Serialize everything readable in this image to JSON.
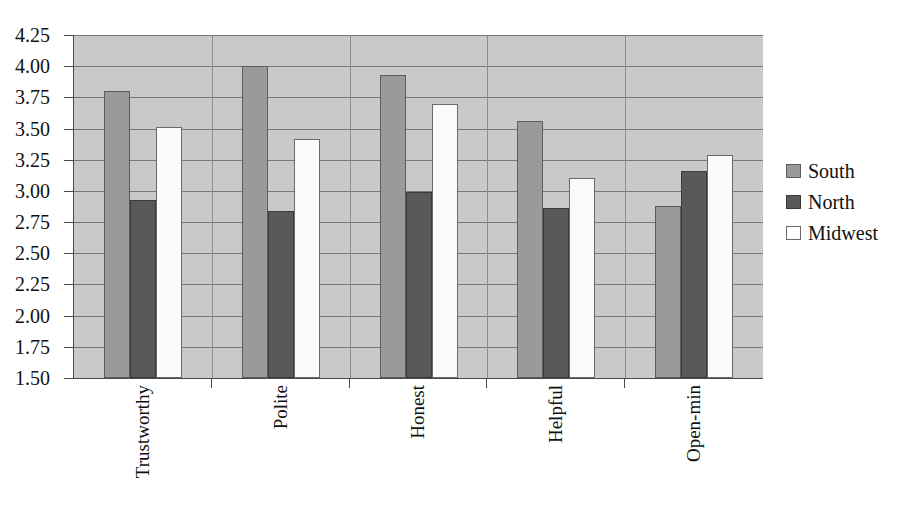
{
  "chart_data": {
    "type": "bar",
    "title": "",
    "xlabel": "",
    "ylabel": "",
    "categories": [
      "Trustworthy",
      "Polite",
      "Honest",
      "Helpful",
      "Open-min"
    ],
    "series": [
      {
        "name": "South",
        "color": "#9a9a9a",
        "values": [
          3.8,
          4.0,
          3.93,
          3.56,
          2.88
        ]
      },
      {
        "name": "North",
        "color": "#595959",
        "values": [
          2.93,
          2.84,
          2.99,
          2.86,
          3.16
        ]
      },
      {
        "name": "Midwest",
        "color": "#ffffff",
        "values": [
          3.51,
          3.42,
          3.7,
          3.1,
          3.29
        ]
      }
    ],
    "ylim": [
      1.5,
      4.25
    ],
    "ytick_labels": [
      "4.25",
      "4.00",
      "3.75",
      "3.50",
      "3.25",
      "3.00",
      "2.75",
      "2.50",
      "2.25",
      "2.00",
      "1.75",
      "1.50"
    ],
    "ytick_values": [
      4.25,
      4.0,
      3.75,
      3.5,
      3.25,
      3.0,
      2.75,
      2.5,
      2.25,
      2.0,
      1.75,
      1.5
    ],
    "ytick_step": 0.25,
    "grid": true,
    "legend_position": "right",
    "plot_background": "#c9c9c9",
    "axis_color": "#4a4a4a",
    "gridline_color": "#77777c"
  },
  "legend": {
    "items": [
      {
        "label": "South"
      },
      {
        "label": "North"
      },
      {
        "label": "Midwest"
      }
    ]
  },
  "header": {
    "clipped_title": ""
  }
}
